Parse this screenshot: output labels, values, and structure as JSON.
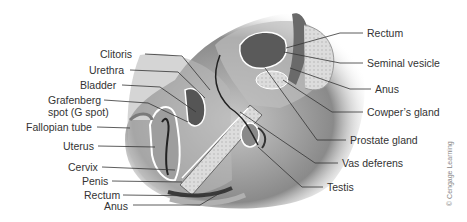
{
  "figure": {
    "credit": "© Cengage Learning",
    "colors": {
      "label_text": "#333333",
      "leader_line": "#333333",
      "background": "#ffffff",
      "tissue_dark": "#3a3a3a",
      "tissue_mid": "#9a9a9a",
      "tissue_light": "#d8d8d8"
    },
    "left_labels": [
      {
        "text": "Clitoris"
      },
      {
        "text": "Urethra"
      },
      {
        "text": "Bladder"
      },
      {
        "text": "Grafenberg"
      },
      {
        "text": "spot (G spot)"
      },
      {
        "text": "Fallopian tube"
      },
      {
        "text": "Uterus"
      },
      {
        "text": "Cervix"
      },
      {
        "text": "Penis"
      },
      {
        "text": "Rectum"
      },
      {
        "text": "Anus"
      }
    ],
    "right_labels": [
      {
        "text": "Rectum"
      },
      {
        "text": "Seminal vesicle"
      },
      {
        "text": "Anus"
      },
      {
        "text": "Cowper’s gland"
      },
      {
        "text": "Prostate gland"
      },
      {
        "text": "Vas deferens"
      },
      {
        "text": "Testis"
      }
    ]
  }
}
